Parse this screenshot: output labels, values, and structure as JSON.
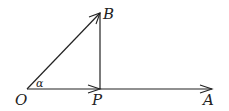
{
  "diagram": {
    "type": "vector-geometry",
    "points": {
      "O": {
        "label": "O",
        "x": 27,
        "y": 89
      },
      "P": {
        "label": "P",
        "x": 100,
        "y": 89
      },
      "B": {
        "label": "B",
        "x": 100,
        "y": 13
      },
      "A": {
        "label": "A",
        "x": 212,
        "y": 89
      }
    },
    "angle": {
      "label": "α",
      "vertex": "O",
      "between": [
        "OA",
        "OB"
      ]
    },
    "vectors": [
      {
        "from": "O",
        "to": "B",
        "arrow": true
      },
      {
        "from": "O",
        "to": "P",
        "arrow": true
      },
      {
        "from": "P",
        "to": "A",
        "arrow": true
      }
    ],
    "segments": [
      {
        "from": "P",
        "to": "B",
        "arrow": false
      }
    ],
    "stroke_color": "#222222"
  }
}
